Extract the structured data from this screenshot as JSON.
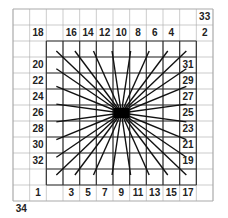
{
  "diagram": {
    "grid": {
      "cols": 12,
      "rows": 12,
      "left": 13,
      "top": 9,
      "cell_w": 16.67,
      "cell_h": 16
    },
    "inner_box": {
      "col_start": 2,
      "col_end": 11,
      "row_start": 2,
      "row_end": 11
    },
    "center": {
      "x": 117,
      "y": 111
    },
    "colors": {
      "grid": "#aaaaaa",
      "inner": "#333333",
      "lines": "#111111",
      "text": "#222222"
    },
    "labels": [
      {
        "text": "33",
        "col": 11,
        "row": 0
      },
      {
        "text": "18",
        "col": 1,
        "row": 1
      },
      {
        "text": "16",
        "col": 3,
        "row": 1
      },
      {
        "text": "14",
        "col": 4,
        "row": 1
      },
      {
        "text": "12",
        "col": 5,
        "row": 1
      },
      {
        "text": "10",
        "col": 6,
        "row": 1
      },
      {
        "text": "8",
        "col": 7,
        "row": 1
      },
      {
        "text": "6",
        "col": 8,
        "row": 1
      },
      {
        "text": "4",
        "col": 9,
        "row": 1
      },
      {
        "text": "2",
        "col": 11,
        "row": 1
      },
      {
        "text": "20",
        "col": 1,
        "row": 3
      },
      {
        "text": "22",
        "col": 1,
        "row": 4
      },
      {
        "text": "24",
        "col": 1,
        "row": 5
      },
      {
        "text": "26",
        "col": 1,
        "row": 6
      },
      {
        "text": "28",
        "col": 1,
        "row": 7
      },
      {
        "text": "30",
        "col": 1,
        "row": 8
      },
      {
        "text": "32",
        "col": 1,
        "row": 9
      },
      {
        "text": "31",
        "col": 10,
        "row": 3
      },
      {
        "text": "29",
        "col": 10,
        "row": 4
      },
      {
        "text": "27",
        "col": 10,
        "row": 5
      },
      {
        "text": "25",
        "col": 10,
        "row": 6
      },
      {
        "text": "23",
        "col": 10,
        "row": 7
      },
      {
        "text": "21",
        "col": 10,
        "row": 8
      },
      {
        "text": "19",
        "col": 10,
        "row": 9
      },
      {
        "text": "1",
        "col": 1,
        "row": 11
      },
      {
        "text": "3",
        "col": 3,
        "row": 11
      },
      {
        "text": "5",
        "col": 4,
        "row": 11
      },
      {
        "text": "7",
        "col": 5,
        "row": 11
      },
      {
        "text": "9",
        "col": 6,
        "row": 11
      },
      {
        "text": "11",
        "col": 7,
        "row": 11
      },
      {
        "text": "13",
        "col": 8,
        "row": 11
      },
      {
        "text": "15",
        "col": 9,
        "row": 11
      },
      {
        "text": "17",
        "col": 10,
        "row": 11
      },
      {
        "text": "34",
        "col": 0,
        "row": 12
      }
    ]
  }
}
